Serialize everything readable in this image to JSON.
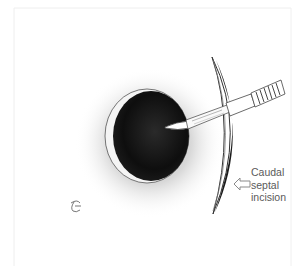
{
  "figure": {
    "annotation": {
      "lines": [
        "Caudal",
        "septal",
        "incision"
      ],
      "arrow_direction": "left"
    },
    "signature_mark": "artist-monogram",
    "colors": {
      "background": "#ffffff",
      "frame": "#eeeeee",
      "cavity": "#111111",
      "halo": "#bdbdbd",
      "septum_edge": "#222222",
      "label_text": "#5a5a5a",
      "arrow_stroke": "#8a8a8a"
    }
  }
}
